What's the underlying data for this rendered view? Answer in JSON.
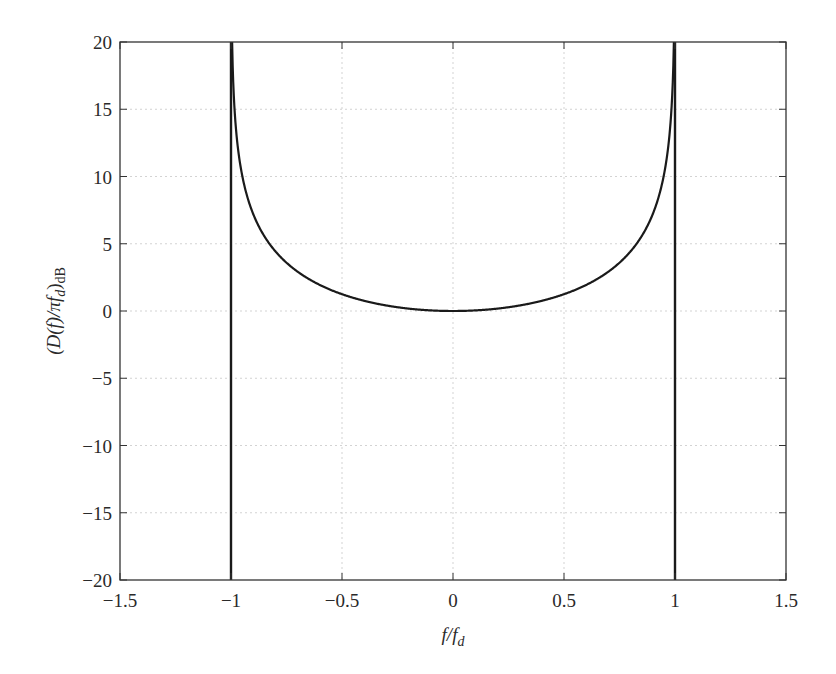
{
  "chart_data": {
    "type": "line",
    "title": "",
    "xlabel": "f/f_d",
    "ylabel": "(D(f)/πf_d)_dB",
    "xlim": [
      -1.5,
      1.5
    ],
    "ylim": [
      -20,
      20
    ],
    "grid": true,
    "legend": null,
    "x_ticks": [
      -1.5,
      -1,
      -0.5,
      0,
      0.5,
      1,
      1.5
    ],
    "x_tick_labels": [
      "−1.5",
      "−1",
      "−0.5",
      "0",
      "0.5",
      "1",
      "1.5"
    ],
    "y_ticks": [
      20,
      15,
      10,
      5,
      0,
      -5,
      -10,
      -15,
      -20
    ],
    "y_tick_labels": [
      "20",
      "15",
      "10",
      "5",
      "0",
      "−5",
      "−10",
      "−15",
      "−20"
    ],
    "series": [
      {
        "name": "Jakes Doppler spectrum",
        "formula": "-10*log10(1-(f/f_d)^2) for |f/f_d|<1",
        "x": [
          -0.999,
          -0.99,
          -0.98,
          -0.95,
          -0.9,
          -0.85,
          -0.8,
          -0.7,
          -0.6,
          -0.5,
          -0.4,
          -0.3,
          -0.2,
          -0.1,
          0,
          0.1,
          0.2,
          0.3,
          0.4,
          0.5,
          0.6,
          0.7,
          0.8,
          0.85,
          0.9,
          0.95,
          0.98,
          0.99,
          0.999
        ],
        "values": [
          27.0,
          17.0,
          14.0,
          10.1,
          7.2,
          5.6,
          4.4,
          2.9,
          1.9,
          1.25,
          0.76,
          0.41,
          0.18,
          0.04,
          0,
          0.04,
          0.18,
          0.41,
          0.76,
          1.25,
          1.9,
          2.9,
          4.4,
          5.6,
          7.2,
          10.1,
          14.0,
          17.0,
          27.0
        ]
      }
    ],
    "annotations": [
      {
        "type": "vertical-line",
        "x": -1,
        "from": -20,
        "to": 20
      },
      {
        "type": "vertical-line",
        "x": 1,
        "from": -20,
        "to": 20
      }
    ]
  },
  "labels": {
    "xlabel_main": "f/f",
    "xlabel_sub": "d",
    "ylabel_main": "(D(f)/πf",
    "ylabel_sub": "d",
    "ylabel_close": ")",
    "ylabel_unit": "dB"
  },
  "style": {
    "line_color": "#1a1a1a",
    "axis_color": "#333333",
    "grid_color": "#c8c8c8",
    "background": "#ffffff"
  }
}
